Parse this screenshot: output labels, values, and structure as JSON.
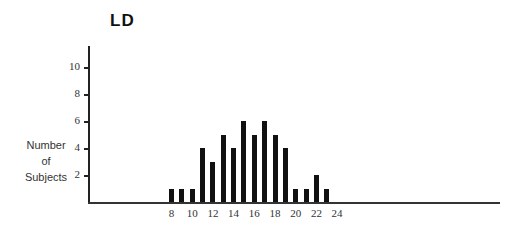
{
  "chart_data": {
    "type": "bar",
    "title": "LD",
    "xlabel": "",
    "ylabel": "Number of Subjects",
    "ylabel_lines": [
      "Number",
      "of",
      "Subjects"
    ],
    "categories": [
      8,
      9,
      10,
      11,
      12,
      13,
      14,
      15,
      16,
      17,
      18,
      19,
      20,
      21,
      22,
      23
    ],
    "values": [
      1,
      1,
      1,
      4,
      3,
      5,
      4,
      6,
      5,
      6,
      5,
      4,
      1,
      1,
      2,
      1
    ],
    "x_ticks": [
      "8",
      "10",
      "12",
      "14",
      "16",
      "18",
      "20",
      "22",
      "24"
    ],
    "y_ticks": [
      "2",
      "4",
      "6",
      "8",
      "10"
    ],
    "ylim": [
      0,
      11
    ],
    "xlim": [
      0,
      33
    ],
    "grid": false,
    "legend": null,
    "bar_color": "#111111"
  }
}
